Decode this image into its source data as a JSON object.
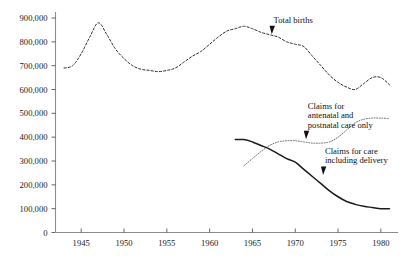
{
  "chart_data": {
    "type": "line",
    "title": "",
    "xlabel": "",
    "ylabel": "",
    "xlim": [
      1942,
      1982
    ],
    "ylim": [
      0,
      900000
    ],
    "grid": false,
    "legend_position": "inline-annotations",
    "x_ticks": [
      "1945",
      "1950",
      "1955",
      "1960",
      "1965",
      "1970",
      "1975",
      "1980"
    ],
    "x_tick_values": [
      1945,
      1950,
      1955,
      1960,
      1965,
      1970,
      1975,
      1980
    ],
    "y_ticks": [
      "0",
      "100,000",
      "200,000",
      "300,000",
      "400,000",
      "500,000",
      "600,000",
      "700,000",
      "800,000",
      "900,000"
    ],
    "y_tick_values": [
      0,
      100000,
      200000,
      300000,
      400000,
      500000,
      600000,
      700000,
      800000,
      900000
    ],
    "series": [
      {
        "name": "Total births",
        "style": "dashed",
        "color": "#2b2b2b",
        "x": [
          1943,
          1944,
          1945,
          1946,
          1947,
          1948,
          1949,
          1950,
          1951,
          1952,
          1953,
          1954,
          1955,
          1956,
          1957,
          1958,
          1959,
          1960,
          1961,
          1962,
          1963,
          1964,
          1965,
          1966,
          1967,
          1968,
          1969,
          1970,
          1971,
          1972,
          1973,
          1974,
          1975,
          1976,
          1977,
          1978,
          1979,
          1980,
          1981
        ],
        "values": [
          690000,
          700000,
          750000,
          820000,
          880000,
          830000,
          770000,
          730000,
          700000,
          685000,
          680000,
          675000,
          680000,
          690000,
          715000,
          740000,
          760000,
          790000,
          820000,
          845000,
          855000,
          865000,
          855000,
          840000,
          830000,
          820000,
          800000,
          790000,
          780000,
          740000,
          700000,
          660000,
          630000,
          610000,
          600000,
          625000,
          650000,
          650000,
          620000
        ]
      },
      {
        "name": "Claims for antenatal and postnatal care only",
        "style": "dotted",
        "color": "#6d6d6d",
        "x": [
          1964,
          1965,
          1966,
          1967,
          1968,
          1969,
          1970,
          1971,
          1972,
          1973,
          1974,
          1975,
          1976,
          1977,
          1978,
          1979,
          1980,
          1981
        ],
        "values": [
          280000,
          310000,
          340000,
          365000,
          380000,
          385000,
          385000,
          380000,
          375000,
          375000,
          380000,
          400000,
          430000,
          460000,
          475000,
          480000,
          480000,
          478000
        ]
      },
      {
        "name": "Claims for care including delivery",
        "style": "solid",
        "color": "#1c1c1c",
        "x": [
          1963,
          1964,
          1965,
          1966,
          1967,
          1968,
          1969,
          1970,
          1971,
          1972,
          1973,
          1974,
          1975,
          1976,
          1977,
          1978,
          1979,
          1980,
          1981
        ],
        "values": [
          390000,
          390000,
          380000,
          365000,
          350000,
          330000,
          310000,
          295000,
          265000,
          235000,
          205000,
          175000,
          150000,
          130000,
          118000,
          110000,
          105000,
          100000,
          100000
        ]
      }
    ],
    "annotations": [
      {
        "name": "total-births",
        "lines": [
          "Total births"
        ],
        "text": "Total births",
        "x": 1967,
        "y": 880000,
        "arrow": "down"
      },
      {
        "name": "antenatal-postnatal",
        "lines": [
          "Claims for",
          "antenatal and",
          "postnatal care only"
        ],
        "text": "Claims for antenatal and postnatal care only",
        "x": 1971,
        "y": 520000,
        "arrow": "down"
      },
      {
        "name": "care-including-delivery",
        "lines": [
          "Claims for care",
          "including delivery"
        ],
        "text": "Claims for care including delivery",
        "x": 1973,
        "y": 330000,
        "arrow": "down"
      }
    ]
  }
}
